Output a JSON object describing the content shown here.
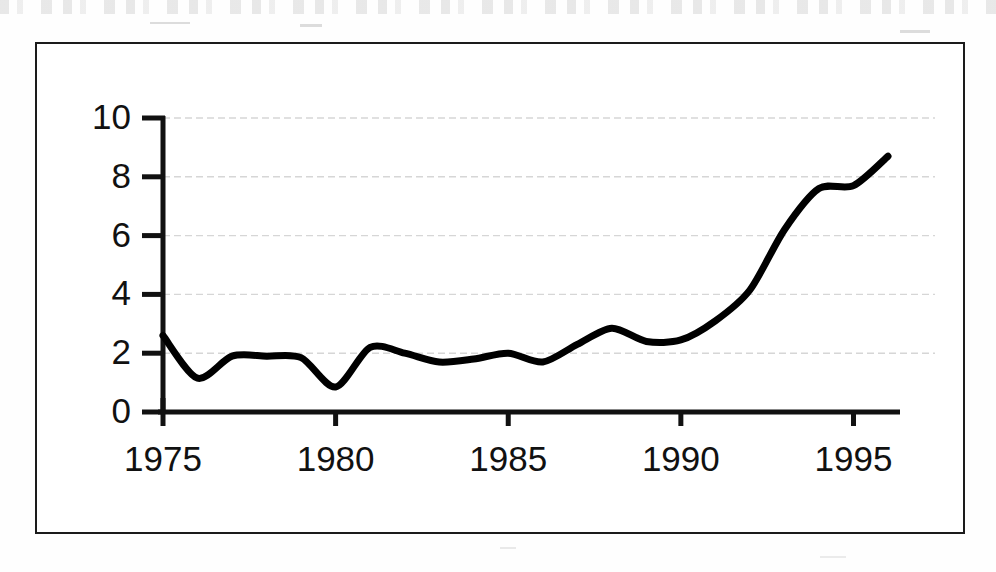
{
  "figure": {
    "kind": "scanned-line-chart",
    "frame_color": "#1b1b1b",
    "background_color": "#ffffff",
    "line_color": "#000000",
    "gridline_color": "#c9c9c9"
  },
  "chart_data": {
    "type": "line",
    "title": "",
    "subtitle": "",
    "xlabel": "",
    "ylabel": "",
    "xlim": [
      1975,
      1996
    ],
    "ylim": [
      0,
      10
    ],
    "xticks": [
      1975,
      1980,
      1985,
      1990,
      1995
    ],
    "xtick_labels": [
      "1975",
      "1980",
      "1985",
      "1990",
      "1995"
    ],
    "yticks": [
      0,
      2,
      4,
      6,
      8,
      10
    ],
    "ytick_labels": [
      "0",
      "2",
      "4",
      "6",
      "8",
      "10"
    ],
    "grid": true,
    "grid_axis": "y",
    "legend": null,
    "legend_position": "none",
    "annotations": [],
    "x": [
      1975,
      1976,
      1977,
      1978,
      1979,
      1980,
      1981,
      1982,
      1983,
      1984,
      1985,
      1986,
      1987,
      1988,
      1989,
      1990,
      1991,
      1992,
      1993,
      1994,
      1995,
      1996
    ],
    "values": [
      2.6,
      1.15,
      1.9,
      1.9,
      1.85,
      0.85,
      2.2,
      2.0,
      1.7,
      1.8,
      2.0,
      1.7,
      2.3,
      2.85,
      2.4,
      2.45,
      3.1,
      4.15,
      6.2,
      7.6,
      7.7,
      8.7
    ],
    "series": [
      {
        "name": "series-1",
        "values": [
          2.6,
          1.15,
          1.9,
          1.9,
          1.85,
          0.85,
          2.2,
          2.0,
          1.7,
          1.8,
          2.0,
          1.7,
          2.3,
          2.85,
          2.4,
          2.45,
          3.1,
          4.15,
          6.2,
          7.6,
          7.7,
          8.7
        ],
        "color": "#000000",
        "linewidth": 7,
        "marker": "none",
        "smooth": true
      }
    ]
  }
}
